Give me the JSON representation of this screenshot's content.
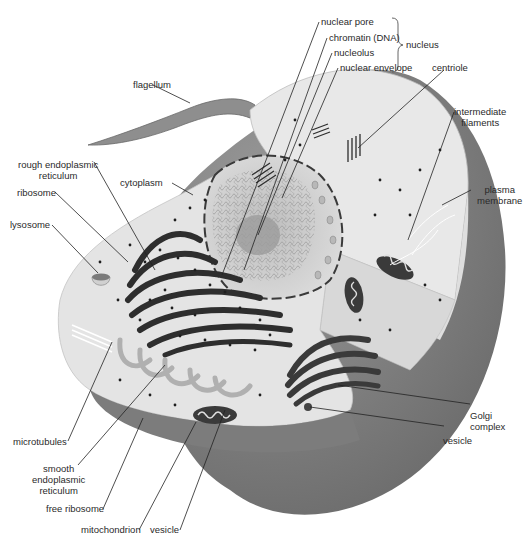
{
  "diagram": {
    "colors": {
      "background": "#ffffff",
      "cytoplasm": "#e6e6e6",
      "cytoplasm_cut": "#d9d9d9",
      "outer_shell": "#7a7a7a",
      "organelle_dark": "#2e2e2e",
      "flagellum": "#8a8a8a",
      "leader_line": "#222222"
    },
    "labels": {
      "nuclear_pore": "nuclear pore",
      "chromatin": "chromatin (DNA)",
      "nucleolus": "nucleolus",
      "nuclear_envelope": "nuclear envelope",
      "nucleus": "nucleus",
      "centriole": "centriole",
      "flagellum": "flagellum",
      "intermediate_filaments_1": "intermediate",
      "intermediate_filaments_2": "filaments",
      "rough_er_1": "rough endoplasmic",
      "rough_er_2": "reticulum",
      "cytoplasm": "cytoplasm",
      "plasma_membrane_1": "plasma",
      "plasma_membrane_2": "membrane",
      "ribosome": "ribosome",
      "lysosome": "lysosome",
      "golgi_1": "Golgi",
      "golgi_2": "complex",
      "vesicle_right": "vesicle",
      "microtubules": "microtubules",
      "smooth_er_1": "smooth",
      "smooth_er_2": "endoplasmic",
      "smooth_er_3": "reticulum",
      "free_ribosome": "free ribosome",
      "mitochondrion": "mitochondrion",
      "vesicle_bottom": "vesicle"
    }
  }
}
